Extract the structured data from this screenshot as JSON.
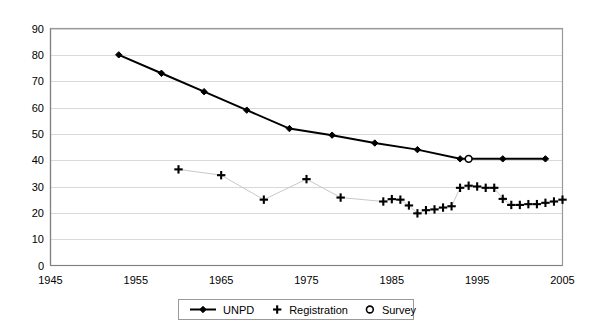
{
  "chart_data": {
    "type": "line",
    "title": "",
    "subtitle": "",
    "xlabel": "",
    "ylabel": "",
    "xlim": [
      1945,
      2005
    ],
    "ylim": [
      0,
      90
    ],
    "xticks": [
      1945,
      1955,
      1965,
      1975,
      1985,
      1995,
      2005
    ],
    "yticks": [
      0,
      10,
      20,
      30,
      40,
      50,
      60,
      70,
      80,
      90
    ],
    "grid": "horizontal",
    "legend_position": "bottom",
    "series": [
      {
        "name": "UNPD",
        "marker": "diamond",
        "line": true,
        "color": "#000000",
        "points": [
          {
            "x": 1953,
            "y": 80
          },
          {
            "x": 1958,
            "y": 73
          },
          {
            "x": 1963,
            "y": 66
          },
          {
            "x": 1968,
            "y": 59
          },
          {
            "x": 1973,
            "y": 52
          },
          {
            "x": 1978,
            "y": 49.5
          },
          {
            "x": 1983,
            "y": 46.5
          },
          {
            "x": 1988,
            "y": 44
          },
          {
            "x": 1993,
            "y": 40.5
          },
          {
            "x": 1998,
            "y": 40.5
          },
          {
            "x": 2003,
            "y": 40.5
          }
        ]
      },
      {
        "name": "Registration",
        "marker": "plus",
        "line": true,
        "color": "#c9c9c9",
        "points": [
          {
            "x": 1960,
            "y": 36.5
          },
          {
            "x": 1965,
            "y": 34.3
          },
          {
            "x": 1970,
            "y": 25.0
          },
          {
            "x": 1975,
            "y": 32.8
          },
          {
            "x": 1979,
            "y": 25.8
          },
          {
            "x": 1984,
            "y": 24.3
          },
          {
            "x": 1985,
            "y": 25.2
          },
          {
            "x": 1986,
            "y": 25.0
          },
          {
            "x": 1987,
            "y": 22.8
          },
          {
            "x": 1988,
            "y": 19.8
          },
          {
            "x": 1989,
            "y": 21.0
          },
          {
            "x": 1990,
            "y": 21.3
          },
          {
            "x": 1991,
            "y": 22.0
          },
          {
            "x": 1992,
            "y": 22.5
          },
          {
            "x": 1993,
            "y": 29.5
          },
          {
            "x": 1994,
            "y": 30.3
          },
          {
            "x": 1995,
            "y": 30.0
          },
          {
            "x": 1996,
            "y": 29.5
          },
          {
            "x": 1997,
            "y": 29.5
          },
          {
            "x": 1998,
            "y": 25.3
          },
          {
            "x": 1999,
            "y": 23.0
          },
          {
            "x": 2000,
            "y": 23.0
          },
          {
            "x": 2001,
            "y": 23.3
          },
          {
            "x": 2002,
            "y": 23.3
          },
          {
            "x": 2003,
            "y": 23.8
          },
          {
            "x": 2004,
            "y": 24.3
          },
          {
            "x": 2005,
            "y": 25.0
          }
        ]
      },
      {
        "name": "Survey",
        "marker": "circle",
        "line": false,
        "color": "#000000",
        "points": [
          {
            "x": 1994,
            "y": 40.5
          }
        ]
      }
    ],
    "legend": [
      {
        "label": "UNPD",
        "marker": "line-diamond"
      },
      {
        "label": "Registration",
        "marker": "plus"
      },
      {
        "label": "Survey",
        "marker": "circle"
      }
    ]
  },
  "axis": {
    "y_tick_labels": [
      "90",
      "80",
      "70",
      "60",
      "50",
      "40",
      "30",
      "20",
      "10",
      "0"
    ],
    "x_tick_labels": [
      "1945",
      "1955",
      "1965",
      "1975",
      "1985",
      "1995",
      "2005"
    ]
  },
  "colors": {
    "grid": "#d9d9d9",
    "axis": "#808080",
    "unpd": "#000000",
    "registration": "#c9c9c9",
    "survey": "#000000",
    "background": "#ffffff"
  }
}
